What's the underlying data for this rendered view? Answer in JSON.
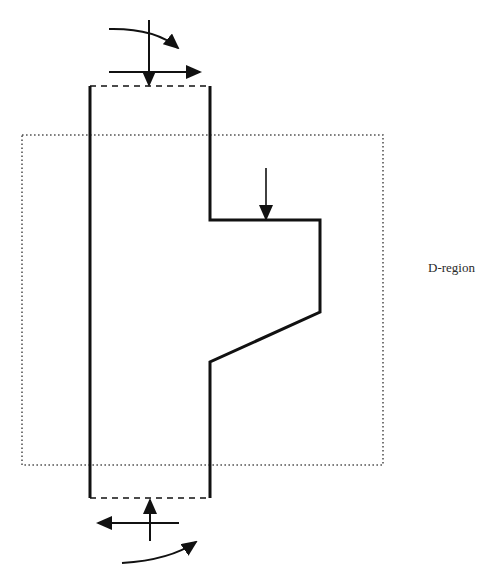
{
  "diagram": {
    "type": "structural-member-d-region",
    "top_caption_cropped": "",
    "labels": {
      "d_region": "D-region"
    },
    "colors": {
      "line": "#111111",
      "dotted_boundary": "#555555",
      "background": "#ffffff"
    },
    "elements": {
      "column": {
        "left_x": 90,
        "right_x": 210,
        "top_y": 86,
        "bottom_y": 498
      },
      "corbel": {
        "top_y": 220,
        "outer_x": 320,
        "outer_bottom_y": 312,
        "root_bottom_y": 362
      },
      "d_region_box": {
        "x": 22,
        "y": 135,
        "width": 361,
        "height": 330
      },
      "top_forces": [
        "moment (clockwise curved arrow)",
        "shear (horizontal arrow, right)",
        "axial (vertical arrow, down)"
      ],
      "corbel_load": "vertical point load (down)",
      "bottom_forces": [
        "moment (curved arrow)",
        "shear (horizontal arrow, left)",
        "axial (vertical arrow, up)"
      ]
    }
  }
}
